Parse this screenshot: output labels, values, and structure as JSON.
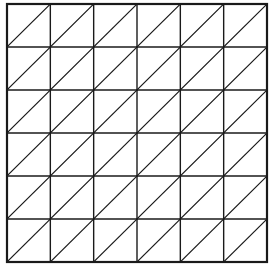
{
  "diagram": {
    "type": "triangulated-square-grid",
    "rows": 6,
    "cols": 6,
    "diagonal_direction": "bottom-left-to-top-right",
    "bounds": {
      "x": 7,
      "y": 4,
      "width": 260,
      "height": 258
    },
    "line_color": "#1a1a1a",
    "background": "#ffffff",
    "outer_stroke_width": 2.2,
    "inner_stroke_width": 1.4,
    "diagonal_stroke_width": 1.2
  }
}
